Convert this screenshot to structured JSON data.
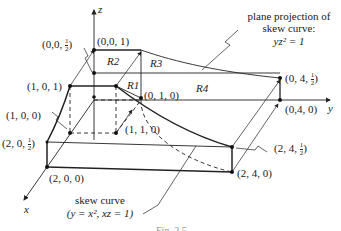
{
  "figure": {
    "axes": {
      "x": "x",
      "y": "y",
      "z": "z"
    },
    "regions": [
      "R1",
      "R2",
      "R3",
      "R4"
    ],
    "points": [
      {
        "id": "p001",
        "label": "(0,0, 1)"
      },
      {
        "id": "p00h",
        "label_prefix": "(0,0, ",
        "num": "1",
        "den": "2",
        "label_suffix": ")"
      },
      {
        "id": "p101",
        "label": "(1, 0, 1)"
      },
      {
        "id": "p100",
        "label": "(1, 0, 0)"
      },
      {
        "id": "p010",
        "label": "(0, 1, 0)"
      },
      {
        "id": "p110",
        "label": "(1, 1, 0)"
      },
      {
        "id": "p20h",
        "label_prefix": "(2, 0, ",
        "num": "1",
        "den": "2",
        "label_suffix": ")"
      },
      {
        "id": "p200",
        "label": "(2, 0, 0)"
      },
      {
        "id": "p04h",
        "label_prefix": "(0, 4, ",
        "num": "1",
        "den": "2",
        "label_suffix": ")"
      },
      {
        "id": "p040",
        "label": "(0,4, 0)"
      },
      {
        "id": "p24h",
        "label_prefix": "(2, 4, ",
        "num": "1",
        "den": "2",
        "label_suffix": ")"
      },
      {
        "id": "p240",
        "label": "(2, 4, 0)"
      }
    ],
    "annotations": {
      "plane_projection": {
        "line1": "plane projection of",
        "line2": "skew curve:",
        "equation": "yz² = 1"
      },
      "skew_curve": {
        "line1": "skew curve",
        "equation": "(y = x², xz = 1)"
      }
    },
    "caption": "Fig. 2.5"
  }
}
